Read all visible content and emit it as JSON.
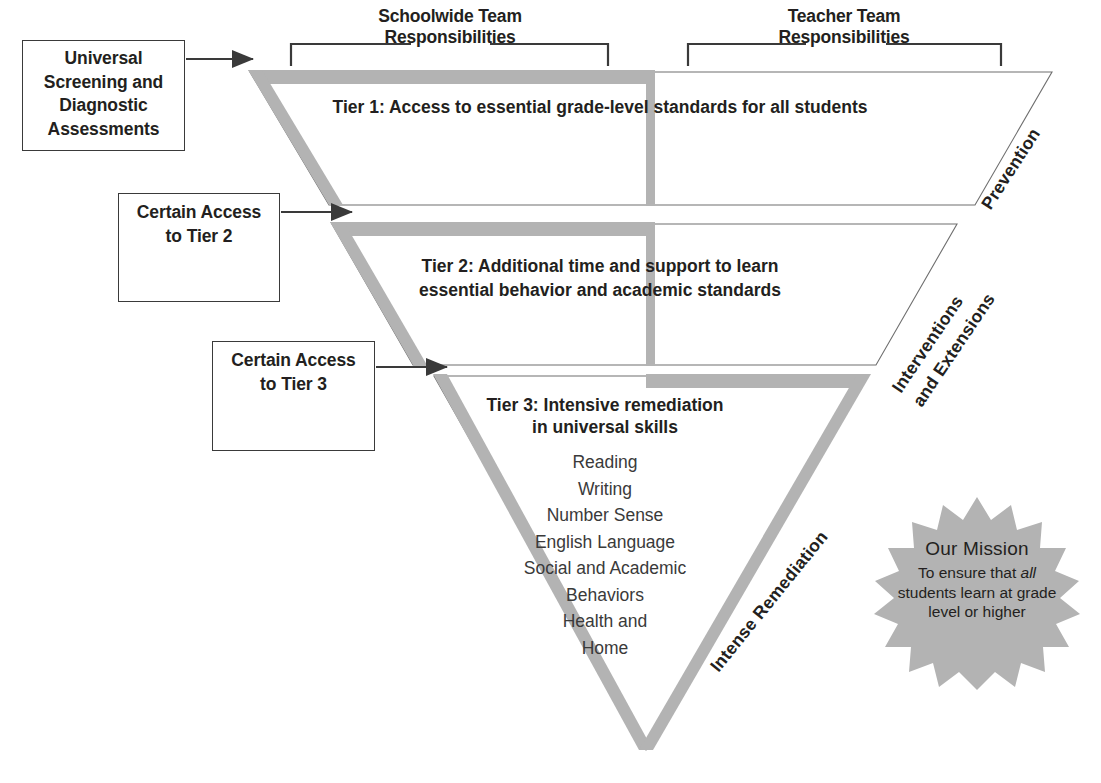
{
  "colors": {
    "gray_band": "#b3b3b3",
    "outline": "#3a3a3a",
    "text": "#231f20",
    "starburst": "#b3b3b3"
  },
  "headers": {
    "schoolwide": "Schoolwide Team\nResponsibilities",
    "schoolwide_line1": "Schoolwide Team",
    "schoolwide_line2": "Responsibilities",
    "teacher_line1": "Teacher Team",
    "teacher_line2": "Responsibilities"
  },
  "input_boxes": [
    {
      "id": "universal",
      "lines": [
        "Universal",
        "Screening and",
        "Diagnostic",
        "Assessments"
      ],
      "text": "Universal Screening and Diagnostic Assessments"
    },
    {
      "id": "tier2",
      "lines": [
        "Certain Access",
        "to Tier 2"
      ],
      "text": "Certain Access to Tier 2"
    },
    {
      "id": "tier3",
      "lines": [
        "Certain Access",
        "to Tier 3"
      ],
      "text": "Certain Access to Tier 3"
    }
  ],
  "tiers": [
    {
      "id": "tier1",
      "label": "Tier 1",
      "text": "Tier 1: Access to essential grade-level standards for all students",
      "side_label": "Prevention"
    },
    {
      "id": "tier2",
      "label": "Tier 2",
      "line1": "Tier 2: Additional time and support to learn",
      "line2": "essential behavior and academic standards",
      "text": "Tier 2: Additional time and support to learn essential behavior and academic standards",
      "side_label_line1": "Interventions",
      "side_label_line2": "and Extensions"
    },
    {
      "id": "tier3",
      "label": "Tier 3",
      "line1": "Tier 3: Intensive remediation",
      "line2": "in universal skills",
      "text": "Tier 3: Intensive remediation in universal skills",
      "side_label": "Intense Remediation",
      "skills": [
        "Reading",
        "Writing",
        "Number Sense",
        "English Language",
        "Social and Academic",
        "Behaviors",
        "Health and",
        "Home"
      ]
    }
  ],
  "mission": {
    "title": "Our Mission",
    "line1_pre": "To ensure that ",
    "line1_em": "all",
    "line2": "students learn at grade",
    "line3": "level or higher",
    "full_text": "Our Mission To ensure that all students learn at grade level or higher"
  }
}
